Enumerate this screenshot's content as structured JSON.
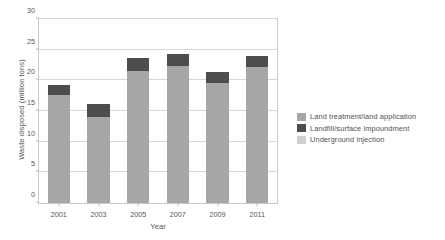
{
  "chart_data": {
    "type": "bar",
    "title": "",
    "subtitle": "",
    "xlabel": "Year",
    "ylabel": "Waste disposed (million tons)",
    "categories": [
      "2001",
      "2003",
      "2005",
      "2007",
      "2009",
      "2011"
    ],
    "ylim": [
      0,
      30
    ],
    "yticks": [
      "0",
      "5",
      "10",
      "15",
      "20",
      "25",
      "30"
    ],
    "ytick_values": [
      0,
      5,
      10,
      15,
      20,
      25,
      30
    ],
    "grid": "horizontal",
    "stacked": true,
    "legend_position": "right",
    "series": [
      {
        "name": "Land treatment/land application",
        "color": "#a6a6a6",
        "values": [
          17.6,
          14.0,
          21.6,
          22.4,
          19.6,
          22.2
        ]
      },
      {
        "name": "Landfill/surface impoundment",
        "color": "#4d4d4d",
        "values": [
          1.7,
          2.1,
          2.0,
          1.9,
          1.8,
          1.7
        ]
      },
      {
        "name": "Underground injection",
        "color": "#d0d0d0",
        "values": [
          0,
          0,
          0,
          0,
          0,
          0
        ]
      }
    ],
    "totals": [
      19.3,
      16.1,
      23.6,
      24.3,
      21.4,
      23.9
    ]
  },
  "legend": {
    "items": [
      {
        "label": "Land treatment/land application",
        "color": "#a6a6a6"
      },
      {
        "label": "Landfill/surface impoundment",
        "color": "#4d4d4d"
      },
      {
        "label": "Underground injection",
        "color": "#d0d0d0"
      }
    ]
  },
  "colors": {
    "plot_background": "#ffffff",
    "grid": "#d8d8d8",
    "axis": "#c9c9c9",
    "text": "#555555"
  }
}
